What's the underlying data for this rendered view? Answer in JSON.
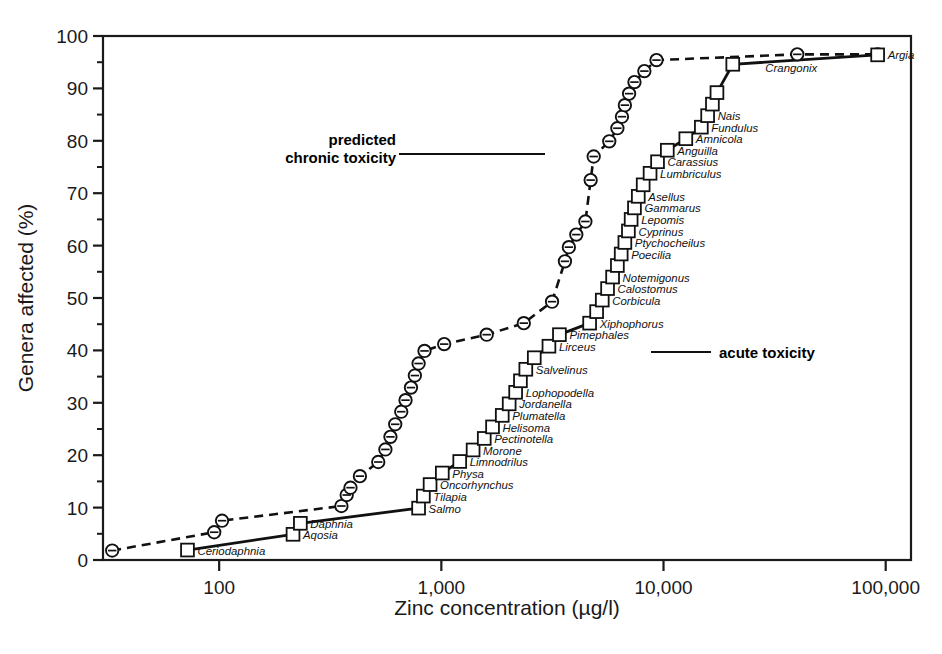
{
  "figure": {
    "ylabel": "Genera affected (%)",
    "xlabel": "Zinc concentration (µg/l)",
    "annotations": {
      "chronic_line1": "predicted",
      "chronic_line2": "chronic toxicity",
      "acute": "acute toxicity"
    }
  },
  "chart_data": {
    "type": "line",
    "title": "",
    "xlabel": "Zinc concentration (µg/l)",
    "ylabel": "Genera affected (%)",
    "xscale": "log",
    "xlim": [
      30,
      130000
    ],
    "ylim": [
      0,
      100
    ],
    "xticks": [
      100,
      1000,
      10000,
      100000
    ],
    "xticklabels": [
      "100",
      "1,000",
      "10,000",
      "100,000"
    ],
    "yticks": [
      0,
      10,
      20,
      30,
      40,
      50,
      60,
      70,
      80,
      90,
      100
    ],
    "yminorticks": [
      5,
      15,
      25,
      35,
      45,
      55,
      65,
      75,
      85,
      95
    ],
    "grid": false,
    "legend": "none",
    "series": [
      {
        "name": "predicted chronic toxicity",
        "style": "dashed",
        "marker": "circle",
        "points": [
          {
            "x": 33,
            "y": 1.8
          },
          {
            "x": 95,
            "y": 5.3
          },
          {
            "x": 103,
            "y": 7.5
          },
          {
            "x": 355,
            "y": 10.3
          },
          {
            "x": 375,
            "y": 12.4
          },
          {
            "x": 390,
            "y": 13.8
          },
          {
            "x": 430,
            "y": 16.0
          },
          {
            "x": 520,
            "y": 18.7
          },
          {
            "x": 560,
            "y": 21.1
          },
          {
            "x": 590,
            "y": 23.5
          },
          {
            "x": 620,
            "y": 25.9
          },
          {
            "x": 660,
            "y": 28.3
          },
          {
            "x": 690,
            "y": 30.5
          },
          {
            "x": 730,
            "y": 32.9
          },
          {
            "x": 760,
            "y": 35.2
          },
          {
            "x": 790,
            "y": 37.5
          },
          {
            "x": 840,
            "y": 39.9
          },
          {
            "x": 1030,
            "y": 41.2
          },
          {
            "x": 1600,
            "y": 43.0
          },
          {
            "x": 2350,
            "y": 45.2
          },
          {
            "x": 3150,
            "y": 49.3
          },
          {
            "x": 3600,
            "y": 57.0
          },
          {
            "x": 3750,
            "y": 59.7
          },
          {
            "x": 4050,
            "y": 62.1
          },
          {
            "x": 4450,
            "y": 64.6
          },
          {
            "x": 4700,
            "y": 72.5
          },
          {
            "x": 4850,
            "y": 77.0
          },
          {
            "x": 5700,
            "y": 79.9
          },
          {
            "x": 6200,
            "y": 82.4
          },
          {
            "x": 6500,
            "y": 84.6
          },
          {
            "x": 6700,
            "y": 86.8
          },
          {
            "x": 7000,
            "y": 89.0
          },
          {
            "x": 7400,
            "y": 91.2
          },
          {
            "x": 8200,
            "y": 93.3
          },
          {
            "x": 9300,
            "y": 95.4
          },
          {
            "x": 40000,
            "y": 96.5
          },
          {
            "x": 92000,
            "y": 96.5
          }
        ]
      },
      {
        "name": "acute toxicity",
        "style": "solid",
        "marker": "square",
        "points": [
          {
            "x": 72,
            "y": 1.9
          },
          {
            "x": 215,
            "y": 4.9
          },
          {
            "x": 232,
            "y": 7.0
          },
          {
            "x": 790,
            "y": 9.9
          },
          {
            "x": 830,
            "y": 12.2
          },
          {
            "x": 890,
            "y": 14.4
          },
          {
            "x": 1010,
            "y": 16.6
          },
          {
            "x": 1210,
            "y": 18.8
          },
          {
            "x": 1390,
            "y": 21.0
          },
          {
            "x": 1560,
            "y": 23.2
          },
          {
            "x": 1700,
            "y": 25.4
          },
          {
            "x": 1880,
            "y": 27.6
          },
          {
            "x": 2020,
            "y": 29.8
          },
          {
            "x": 2160,
            "y": 32.0
          },
          {
            "x": 2270,
            "y": 34.2
          },
          {
            "x": 2400,
            "y": 36.4
          },
          {
            "x": 2620,
            "y": 38.6
          },
          {
            "x": 3050,
            "y": 40.8
          },
          {
            "x": 3400,
            "y": 43.0
          },
          {
            "x": 4650,
            "y": 45.2
          },
          {
            "x": 5000,
            "y": 47.4
          },
          {
            "x": 5300,
            "y": 49.6
          },
          {
            "x": 5600,
            "y": 51.8
          },
          {
            "x": 5900,
            "y": 54.0
          },
          {
            "x": 6200,
            "y": 56.2
          },
          {
            "x": 6450,
            "y": 58.4
          },
          {
            "x": 6700,
            "y": 60.6
          },
          {
            "x": 6950,
            "y": 62.8
          },
          {
            "x": 7150,
            "y": 65.0
          },
          {
            "x": 7400,
            "y": 67.2
          },
          {
            "x": 7700,
            "y": 69.4
          },
          {
            "x": 8100,
            "y": 71.6
          },
          {
            "x": 8700,
            "y": 73.8
          },
          {
            "x": 9400,
            "y": 76.0
          },
          {
            "x": 10400,
            "y": 78.2
          },
          {
            "x": 12600,
            "y": 80.4
          },
          {
            "x": 14800,
            "y": 82.6
          },
          {
            "x": 15800,
            "y": 84.8
          },
          {
            "x": 16600,
            "y": 87.0
          },
          {
            "x": 17400,
            "y": 89.2
          },
          {
            "x": 20500,
            "y": 94.6
          },
          {
            "x": 92000,
            "y": 96.4
          }
        ]
      }
    ],
    "point_labels_acute": [
      {
        "text": "Ceriodaphnia",
        "x": 72,
        "y": 1.9
      },
      {
        "text": "Aqosia",
        "x": 215,
        "y": 4.9
      },
      {
        "text": "Daphnia",
        "x": 232,
        "y": 7.0
      },
      {
        "text": "Salmo",
        "x": 790,
        "y": 9.9
      },
      {
        "text": "Tilapia",
        "x": 830,
        "y": 12.2
      },
      {
        "text": "Oncorhynchus",
        "x": 890,
        "y": 14.4
      },
      {
        "text": "Physa",
        "x": 1010,
        "y": 16.6
      },
      {
        "text": "Limnodrilus",
        "x": 1210,
        "y": 18.8
      },
      {
        "text": "Morone",
        "x": 1390,
        "y": 21.0
      },
      {
        "text": "Pectinotella",
        "x": 1560,
        "y": 23.2
      },
      {
        "text": "Helisoma",
        "x": 1700,
        "y": 25.4
      },
      {
        "text": "Plumatella",
        "x": 1880,
        "y": 27.6
      },
      {
        "text": "Jordanella",
        "x": 2020,
        "y": 29.8
      },
      {
        "text": "Lophopodella",
        "x": 2160,
        "y": 32.0
      },
      {
        "text": "Salvelinus",
        "x": 2400,
        "y": 36.4
      },
      {
        "text": "Lirceus",
        "x": 3050,
        "y": 40.8
      },
      {
        "text": "Pimephales",
        "x": 3400,
        "y": 43.0
      },
      {
        "text": "Xiphophorus",
        "x": 4650,
        "y": 45.2
      },
      {
        "text": "Corbicula",
        "x": 5300,
        "y": 49.6
      },
      {
        "text": "Calostomus",
        "x": 5600,
        "y": 51.8
      },
      {
        "text": "Notemigonus",
        "x": 5900,
        "y": 54.0
      },
      {
        "text": "Poecilia",
        "x": 6450,
        "y": 58.4
      },
      {
        "text": "Ptychocheilus",
        "x": 6700,
        "y": 60.6
      },
      {
        "text": "Cyprinus",
        "x": 6950,
        "y": 62.8
      },
      {
        "text": "Lepomis",
        "x": 7150,
        "y": 65.0
      },
      {
        "text": "Gammarus",
        "x": 7400,
        "y": 67.2
      },
      {
        "text": "Asellus",
        "x": 7700,
        "y": 69.4
      },
      {
        "text": "Lumbriculus",
        "x": 8700,
        "y": 73.8
      },
      {
        "text": "Carassius",
        "x": 9400,
        "y": 76.0
      },
      {
        "text": "Anguilla",
        "x": 10400,
        "y": 78.2
      },
      {
        "text": "Amnicola",
        "x": 12600,
        "y": 80.4
      },
      {
        "text": "Fundulus",
        "x": 14800,
        "y": 82.6
      },
      {
        "text": "Nais",
        "x": 15800,
        "y": 84.8
      },
      {
        "text": "Argia",
        "x": 92000,
        "y": 96.4
      }
    ],
    "point_labels_chronic": [
      {
        "text": "Crangonix",
        "x": 40000,
        "y": 96.5
      }
    ]
  }
}
